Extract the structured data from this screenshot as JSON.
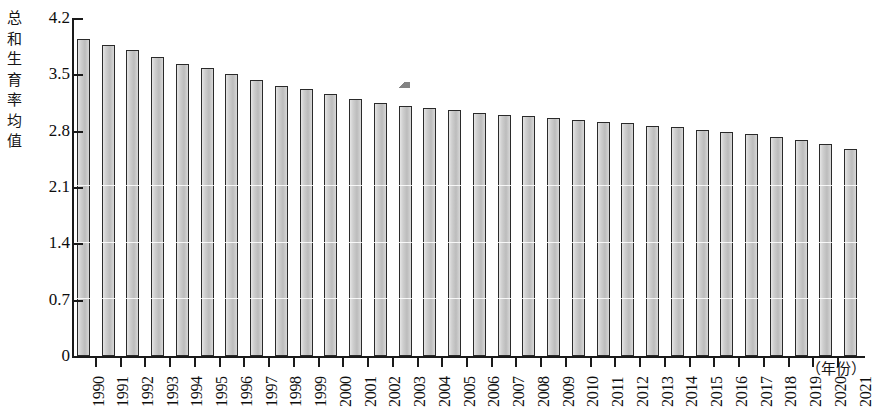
{
  "chart_data": {
    "type": "bar",
    "title": "",
    "subtitle": "",
    "ylabel": "总和生育率均值",
    "xlabel": "（年份）",
    "ylim": [
      0,
      4.2
    ],
    "yticks": [
      "0",
      "0.7",
      "1.4",
      "2.1",
      "2.8",
      "3.5",
      "4.2"
    ],
    "ytick_values": [
      0,
      0.7,
      1.4,
      2.1,
      2.8,
      3.5,
      4.2
    ],
    "grid": false,
    "legend": null,
    "bar_color": "#c6c6c6",
    "bar_edge_color": "#2a2a2a",
    "axis_color": "#1a1a1a",
    "categories": [
      "1990",
      "1991",
      "1992",
      "1993",
      "1994",
      "1995",
      "1996",
      "1997",
      "1998",
      "1999",
      "2000",
      "2001",
      "2002",
      "2003",
      "2004",
      "2005",
      "2006",
      "2007",
      "2008",
      "2009",
      "2010",
      "2011",
      "2012",
      "2013",
      "2014",
      "2015",
      "2016",
      "2017",
      "2018",
      "2019",
      "2020",
      "2021"
    ],
    "values": [
      3.94,
      3.86,
      3.8,
      3.71,
      3.63,
      3.58,
      3.51,
      3.43,
      3.36,
      3.32,
      3.26,
      3.19,
      3.14,
      3.11,
      3.08,
      3.06,
      3.02,
      3.0,
      2.98,
      2.96,
      2.93,
      2.91,
      2.89,
      2.86,
      2.84,
      2.81,
      2.78,
      2.76,
      2.72,
      2.68,
      2.64,
      2.57
    ],
    "annotations": [
      {
        "name": "scan-artifact",
        "x": 399,
        "y": 82
      }
    ]
  },
  "axis": {
    "y_caption_chars": "总\n和\n生\n育\n率\n均\n值",
    "x_caption": "（年份）"
  }
}
